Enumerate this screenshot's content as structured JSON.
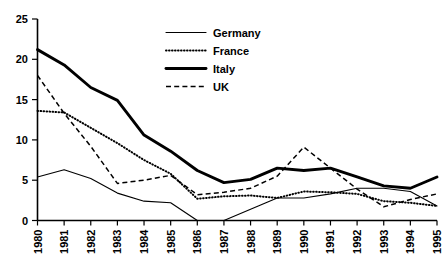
{
  "chart_data": {
    "type": "line",
    "title": "",
    "xlabel": "",
    "ylabel": "",
    "xlim": [
      1980,
      1995
    ],
    "ylim": [
      0,
      25
    ],
    "grid": false,
    "legend_position": "top-center",
    "y_ticks": [
      "0",
      "5",
      "10",
      "15",
      "20",
      "25"
    ],
    "y_tick_values": [
      0,
      5,
      10,
      15,
      20,
      25
    ],
    "categories": [
      "1980",
      "1981",
      "1982",
      "1983",
      "1984",
      "1985",
      "1986",
      "1987",
      "1988",
      "1989",
      "1990",
      "1991",
      "1992",
      "1993",
      "1994",
      "1995"
    ],
    "x": [
      1980,
      1981,
      1982,
      1983,
      1984,
      1985,
      1986,
      1987,
      1988,
      1989,
      1990,
      1991,
      1992,
      1993,
      1994,
      1995
    ],
    "series": [
      {
        "name": "Germany",
        "line_style": "solid-thin",
        "color": "#000000",
        "values": [
          5.4,
          6.3,
          5.2,
          3.4,
          2.4,
          2.2,
          0.0,
          0.0,
          1.4,
          2.8,
          2.8,
          3.3,
          4.0,
          4.0,
          3.6,
          1.8
        ]
      },
      {
        "name": "France",
        "line_style": "dotted",
        "color": "#000000",
        "values": [
          13.6,
          13.4,
          11.5,
          9.6,
          7.5,
          5.8,
          2.7,
          3.0,
          3.1,
          2.8,
          3.6,
          3.5,
          3.3,
          2.4,
          2.2,
          1.8
        ]
      },
      {
        "name": "Italy",
        "line_style": "solid-thick",
        "color": "#000000",
        "values": [
          21.2,
          19.3,
          16.5,
          14.9,
          10.6,
          8.6,
          6.2,
          4.7,
          5.1,
          6.5,
          6.2,
          6.5,
          5.4,
          4.3,
          4.0,
          5.4
        ]
      },
      {
        "name": "UK",
        "line_style": "dashed",
        "color": "#000000",
        "values": [
          18.0,
          13.3,
          9.2,
          4.6,
          5.0,
          5.6,
          3.2,
          3.5,
          4.0,
          5.5,
          9.1,
          6.5,
          3.9,
          1.7,
          2.6,
          3.3
        ]
      }
    ]
  },
  "legend": {
    "entries": [
      {
        "label": "Germany",
        "style": "solid-thin"
      },
      {
        "label": "France",
        "style": "dotted"
      },
      {
        "label": "Italy",
        "style": "solid-thick"
      },
      {
        "label": "UK",
        "style": "dashed"
      }
    ]
  }
}
